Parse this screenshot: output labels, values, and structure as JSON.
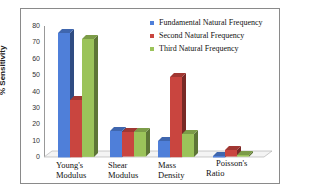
{
  "chart_data": {
    "type": "bar",
    "title": "",
    "xlabel": "",
    "ylabel": "% Sensitivity",
    "ylim": [
      0,
      80
    ],
    "yticks": [
      0,
      10,
      20,
      30,
      40,
      50,
      60,
      70,
      80
    ],
    "grid": false,
    "legend_position": "top-right",
    "categories": [
      "Young's Modulus",
      "Shear Modulus",
      "Mass Density",
      "Poisson's Ratio"
    ],
    "category_lines": [
      [
        "Young's",
        "Modulus"
      ],
      [
        "Shear",
        "Modulus"
      ],
      [
        "Mass",
        "Density"
      ],
      [
        "Poisson's",
        "Ratio"
      ]
    ],
    "series": [
      {
        "name": "Fundamental Natural Frequency",
        "color": "#4f7fd9",
        "values": [
          76,
          16,
          10,
          0.5
        ]
      },
      {
        "name": "Second Natural Frequency",
        "color": "#c9453f",
        "values": [
          35,
          15,
          49,
          4
        ]
      },
      {
        "name": "Third Natural Frequency",
        "color": "#9bc35a",
        "values": [
          72,
          15,
          14,
          1
        ]
      }
    ]
  }
}
